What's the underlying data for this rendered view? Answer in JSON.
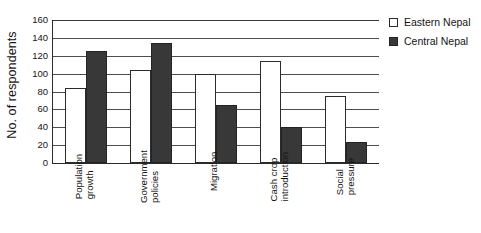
{
  "chart_data": {
    "type": "bar",
    "title": "",
    "subtitle": "",
    "xlabel": "",
    "ylabel": "No. of respondents",
    "ylim": [
      0,
      160
    ],
    "ytick_step": 20,
    "yticks": [
      160,
      140,
      120,
      100,
      80,
      60,
      40,
      20,
      0
    ],
    "ytick_labels": [
      "160",
      "140",
      "120",
      "100",
      "80",
      "60",
      "40",
      "20",
      "0"
    ],
    "grid": "horizontal",
    "legend_position": "right-top",
    "categories": [
      "Population\ngrowth",
      "Government\npolicies",
      "Migration",
      "Cash crop\nintroduction",
      "Social\npressure"
    ],
    "series": [
      {
        "name": "Eastern Nepal",
        "color": "#ffffff",
        "edge_color": "#2b2b2b",
        "values": [
          84,
          104,
          100,
          114,
          75
        ]
      },
      {
        "name": "Central Nepal",
        "color": "#383838",
        "edge_color": "#242424",
        "values": [
          125,
          134,
          65,
          40,
          24
        ]
      }
    ]
  },
  "legend": {
    "items": [
      {
        "label": "Eastern Nepal",
        "swatch": "open-square-swatch"
      },
      {
        "label": "Central Nepal",
        "swatch": "filled-square-swatch"
      }
    ]
  },
  "colors": {
    "axis": "#2b2b2b",
    "gridline": "#4d4d4d",
    "eastern_fill": "#ffffff",
    "central_fill": "#383838",
    "background": "#ffffff",
    "text": "#141414"
  }
}
